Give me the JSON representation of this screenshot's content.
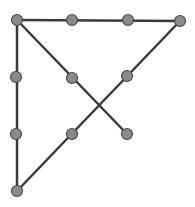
{
  "diagram": {
    "width": 195,
    "height": 207,
    "colors": {
      "background": "#ffffff",
      "line": "#3a3a3a",
      "node_fill": "#8a8a8a",
      "node_stroke": "#4a4a4a"
    },
    "line_width": 2.5,
    "node_radius": 5.5,
    "nodes": [
      {
        "id": "n-top-left",
        "x": 17,
        "y": 20
      },
      {
        "id": "n-top-mid",
        "x": 72,
        "y": 20
      },
      {
        "id": "n-top-right",
        "x": 128,
        "y": 20
      },
      {
        "id": "n-top-ext",
        "x": 180,
        "y": 21
      },
      {
        "id": "n-mid-left",
        "x": 16,
        "y": 77
      },
      {
        "id": "n-center",
        "x": 72,
        "y": 78
      },
      {
        "id": "n-mid-right",
        "x": 127,
        "y": 76
      },
      {
        "id": "n-bot-left",
        "x": 16,
        "y": 134
      },
      {
        "id": "n-bot-mid",
        "x": 72,
        "y": 134
      },
      {
        "id": "n-bot-right",
        "x": 127,
        "y": 134
      },
      {
        "id": "n-bottom-ext",
        "x": 17,
        "y": 191
      }
    ],
    "segments": [
      {
        "id": "seg-diagonal-down",
        "x1": 17,
        "y1": 20,
        "x2": 127,
        "y2": 134
      },
      {
        "id": "seg-top",
        "x1": 17,
        "y1": 20,
        "x2": 180,
        "y2": 21
      },
      {
        "id": "seg-diagonal-up",
        "x1": 180,
        "y1": 21,
        "x2": 17,
        "y2": 191
      },
      {
        "id": "seg-left",
        "x1": 17,
        "y1": 191,
        "x2": 17,
        "y2": 20
      }
    ]
  }
}
